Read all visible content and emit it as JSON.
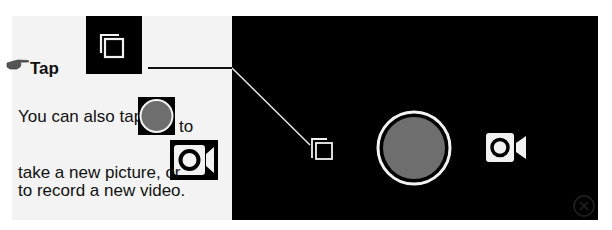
{
  "instruction": {
    "tap_label": "Tap",
    "line1_before": "You can also tap",
    "line1_after": "to",
    "line2": "take a new picture, or",
    "line3": "to record a new video."
  },
  "icons": {
    "pointer": "pointing-hand-icon",
    "gallery": "gallery-switch-icon",
    "shutter": "shutter-button-icon",
    "video": "video-camera-icon"
  },
  "colors": {
    "panel_bg": "#000000",
    "shutter_fill": "#6e6e6e",
    "icon_white": "#f2f2f2",
    "instruction_bg": "#f3f3f3"
  }
}
